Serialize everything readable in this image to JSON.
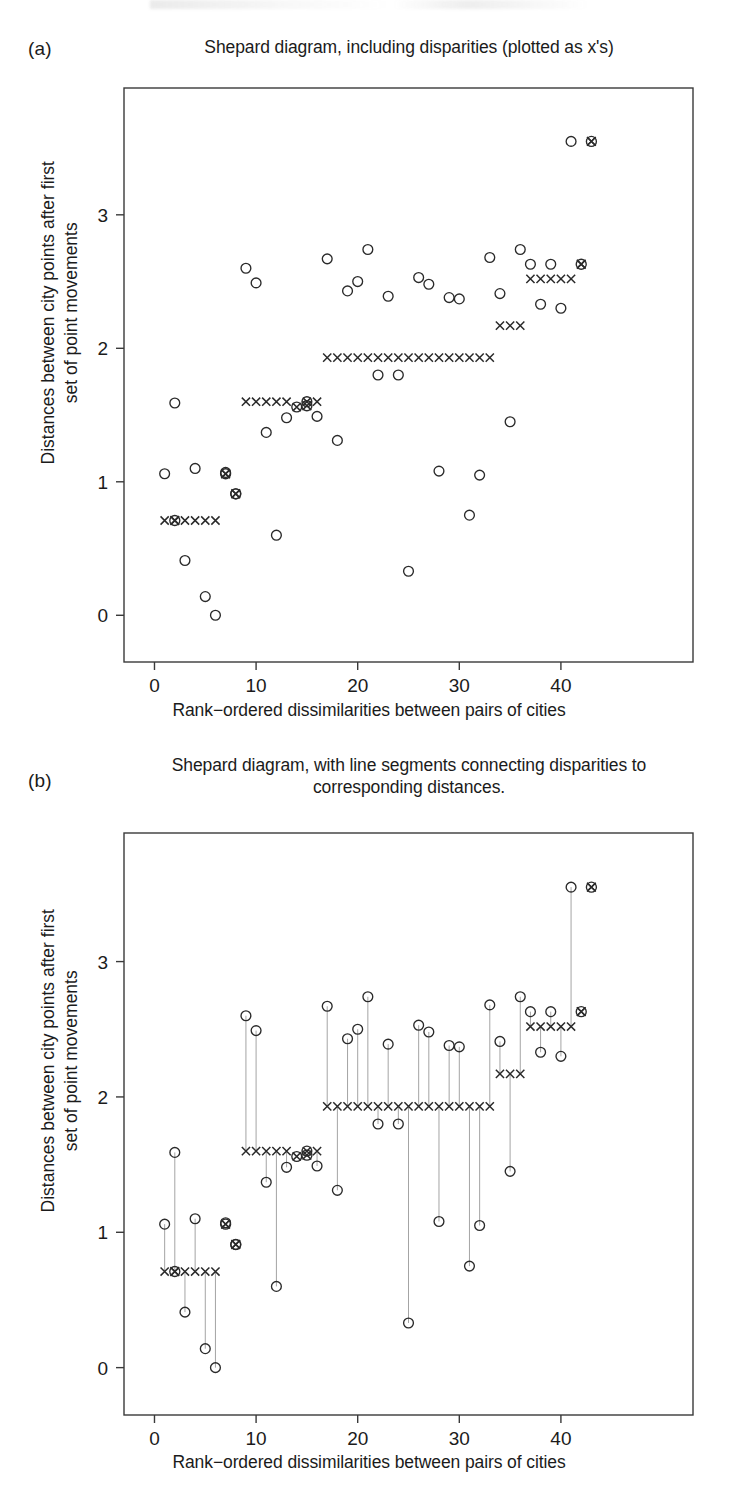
{
  "figure": {
    "panels": [
      {
        "letter": "(a)",
        "title": "Shepard diagram, including disparities (plotted as x's)",
        "xlabel": "Rank−ordered dissimilarities between pairs of cities",
        "ylabel": "Distances between city points after first\nset of point movements"
      },
      {
        "letter": "(b)",
        "title": "Shepard diagram, with line segments connecting\ndisparities to corresponding distances.",
        "xlabel": "Rank−ordered dissimilarities between pairs of cities",
        "ylabel": "Distances between city points after first\nset of point movements"
      }
    ],
    "colors": {
      "ink": "#1b1b1b",
      "axis": "#3a3a3a",
      "marker": "#2a2a2a",
      "segment": "#9a9a9a"
    }
  },
  "chart_data": [
    {
      "type": "scatter",
      "panel": "(a)",
      "title": "Shepard diagram, including disparities (plotted as x's)",
      "xlabel": "Rank−ordered dissimilarities between pairs of cities",
      "ylabel": "Distances between city points after first set of point movements",
      "xlim": [
        -3,
        53
      ],
      "ylim": [
        -0.35,
        3.95
      ],
      "xticks": [
        0,
        10,
        20,
        30,
        40
      ],
      "yticks": [
        0,
        1,
        2,
        3
      ],
      "grid": false,
      "legend": null,
      "show_segments": false,
      "series": [
        {
          "name": "distances",
          "marker": "o",
          "x": [
            1,
            2,
            3,
            4,
            5,
            6,
            7,
            8,
            9,
            10,
            11,
            12,
            13,
            14,
            15,
            16,
            17,
            18,
            19,
            20,
            21,
            22,
            23,
            24,
            25,
            26,
            27,
            28,
            29,
            30,
            31,
            32,
            33,
            34,
            35,
            36,
            37,
            38,
            39,
            40,
            41,
            42,
            43
          ],
          "y": [
            1.06,
            1.59,
            0.41,
            1.1,
            0.14,
            0.0,
            1.07,
            0.91,
            2.6,
            2.49,
            1.37,
            0.6,
            1.48,
            1.56,
            1.6,
            1.49,
            2.67,
            1.31,
            2.43,
            2.5,
            2.74,
            1.8,
            2.39,
            1.8,
            0.33,
            2.53,
            2.48,
            1.08,
            2.38,
            2.37,
            0.75,
            1.05,
            2.68,
            2.41,
            1.45,
            2.74,
            2.63,
            2.33,
            2.63,
            2.3,
            3.55
          ]
        },
        {
          "name": "disparities",
          "marker": "x",
          "x": [
            1,
            2,
            3,
            4,
            5,
            6,
            7,
            8,
            9,
            10,
            11,
            12,
            13,
            14,
            15,
            16,
            17,
            18,
            19,
            20,
            21,
            22,
            23,
            24,
            25,
            26,
            27,
            28,
            29,
            30,
            31,
            32,
            33,
            34,
            35,
            36,
            37,
            38,
            39,
            40,
            41,
            42,
            43
          ],
          "y": [
            0.71,
            0.71,
            0.71,
            0.71,
            0.71,
            0.71,
            1.06,
            0.91,
            1.6,
            1.6,
            1.6,
            1.6,
            1.6,
            1.56,
            1.6,
            1.6,
            1.93,
            1.93,
            1.93,
            1.93,
            1.93,
            1.93,
            1.93,
            1.93,
            1.93,
            1.93,
            1.93,
            1.93,
            1.93,
            1.93,
            1.93,
            1.93,
            1.93,
            2.17,
            2.17,
            2.17,
            2.52,
            2.52,
            2.52,
            2.52,
            2.52,
            2.63,
            3.55
          ]
        }
      ],
      "overlaid_points": [
        {
          "x": 2,
          "y": 0.71
        },
        {
          "x": 7,
          "y": 1.06
        },
        {
          "x": 8,
          "y": 0.91
        },
        {
          "x": 15,
          "y": 1.57
        },
        {
          "x": 43,
          "y": 3.55
        },
        {
          "x": 42,
          "y": 2.63
        }
      ]
    },
    {
      "type": "scatter",
      "panel": "(b)",
      "title": "Shepard diagram, with line segments connecting disparities to corresponding distances.",
      "xlabel": "Rank−ordered dissimilarities between pairs of cities",
      "ylabel": "Distances between city points after first set of point movements",
      "xlim": [
        -3,
        53
      ],
      "ylim": [
        -0.35,
        3.95
      ],
      "xticks": [
        0,
        10,
        20,
        30,
        40
      ],
      "yticks": [
        0,
        1,
        2,
        3
      ],
      "grid": false,
      "legend": null,
      "show_segments": true,
      "series": [
        {
          "name": "distances",
          "marker": "o",
          "x": [
            1,
            2,
            3,
            4,
            5,
            6,
            7,
            8,
            9,
            10,
            11,
            12,
            13,
            14,
            15,
            16,
            17,
            18,
            19,
            20,
            21,
            22,
            23,
            24,
            25,
            26,
            27,
            28,
            29,
            30,
            31,
            32,
            33,
            34,
            35,
            36,
            37,
            38,
            39,
            40,
            41,
            42,
            43
          ],
          "y": [
            1.06,
            1.59,
            0.41,
            1.1,
            0.14,
            0.0,
            1.07,
            0.91,
            2.6,
            2.49,
            1.37,
            0.6,
            1.48,
            1.56,
            1.6,
            1.49,
            2.67,
            1.31,
            2.43,
            2.5,
            2.74,
            1.8,
            2.39,
            1.8,
            0.33,
            2.53,
            2.48,
            1.08,
            2.38,
            2.37,
            0.75,
            1.05,
            2.68,
            2.41,
            1.45,
            2.74,
            2.63,
            2.33,
            2.63,
            2.3,
            3.55
          ]
        },
        {
          "name": "disparities",
          "marker": "x",
          "x": [
            1,
            2,
            3,
            4,
            5,
            6,
            7,
            8,
            9,
            10,
            11,
            12,
            13,
            14,
            15,
            16,
            17,
            18,
            19,
            20,
            21,
            22,
            23,
            24,
            25,
            26,
            27,
            28,
            29,
            30,
            31,
            32,
            33,
            34,
            35,
            36,
            37,
            38,
            39,
            40,
            41,
            42,
            43
          ],
          "y": [
            0.71,
            0.71,
            0.71,
            0.71,
            0.71,
            0.71,
            1.06,
            0.91,
            1.6,
            1.6,
            1.6,
            1.6,
            1.6,
            1.56,
            1.6,
            1.6,
            1.93,
            1.93,
            1.93,
            1.93,
            1.93,
            1.93,
            1.93,
            1.93,
            1.93,
            1.93,
            1.93,
            1.93,
            1.93,
            1.93,
            1.93,
            1.93,
            1.93,
            2.17,
            2.17,
            2.17,
            2.52,
            2.52,
            2.52,
            2.52,
            2.52,
            2.63,
            3.55
          ]
        }
      ],
      "overlaid_points": [
        {
          "x": 2,
          "y": 0.71
        },
        {
          "x": 7,
          "y": 1.06
        },
        {
          "x": 8,
          "y": 0.91
        },
        {
          "x": 15,
          "y": 1.57
        },
        {
          "x": 43,
          "y": 3.55
        },
        {
          "x": 42,
          "y": 2.63
        }
      ]
    }
  ]
}
